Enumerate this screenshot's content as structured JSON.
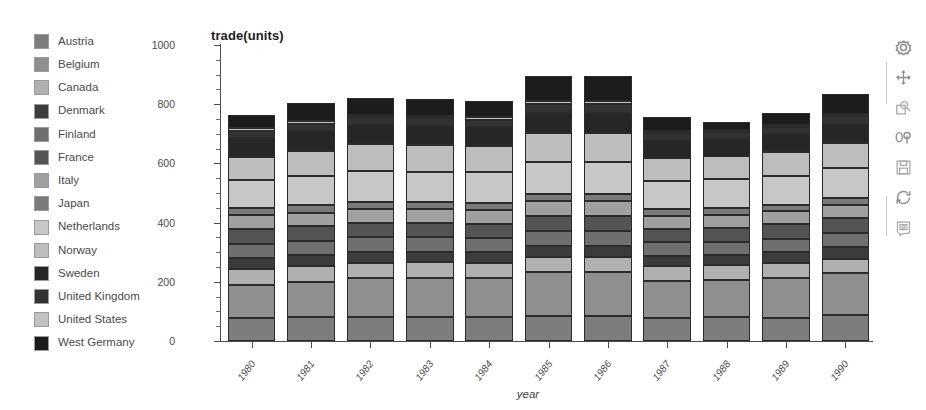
{
  "chart_data": {
    "type": "bar",
    "stacked": true,
    "title": "trade(units)",
    "xlabel": "year",
    "ylabel": "",
    "ylim": [
      0,
      1000
    ],
    "yticks": [
      0,
      200,
      400,
      600,
      800,
      1000
    ],
    "ytick_labels": [
      "0",
      "200",
      "400",
      "600",
      "800",
      "1000"
    ],
    "grid": false,
    "legend_position": "left",
    "categories": [
      "1980",
      "1981",
      "1982",
      "1983",
      "1984",
      "1985",
      "1986",
      "1987",
      "1988",
      "1989",
      "1990"
    ],
    "series": [
      {
        "name": "Austria",
        "color": "#7d7d7d",
        "values": [
          78,
          80,
          80,
          80,
          80,
          86,
          86,
          78,
          80,
          78,
          88
        ]
      },
      {
        "name": "Belgium",
        "color": "#8f8f8f",
        "values": [
          110,
          120,
          132,
          134,
          134,
          146,
          146,
          126,
          126,
          136,
          142
        ]
      },
      {
        "name": "Canada",
        "color": "#b0b0b0",
        "values": [
          55,
          52,
          52,
          52,
          50,
          52,
          52,
          50,
          50,
          50,
          46
        ]
      },
      {
        "name": "Denmark",
        "color": "#3c3c3c",
        "values": [
          38,
          38,
          38,
          36,
          36,
          38,
          38,
          34,
          34,
          36,
          40
        ]
      },
      {
        "name": "Finland",
        "color": "#6f6f6f",
        "values": [
          48,
          48,
          48,
          48,
          48,
          50,
          50,
          46,
          46,
          46,
          48
        ]
      },
      {
        "name": "France",
        "color": "#545454",
        "values": [
          50,
          50,
          50,
          50,
          48,
          52,
          52,
          46,
          46,
          48,
          50
        ]
      },
      {
        "name": "Italy",
        "color": "#a0a0a0",
        "values": [
          46,
          46,
          46,
          46,
          46,
          48,
          48,
          44,
          44,
          44,
          46
        ]
      },
      {
        "name": "Japan",
        "color": "#7a7a7a",
        "values": [
          24,
          24,
          24,
          24,
          24,
          26,
          26,
          22,
          22,
          22,
          24
        ]
      },
      {
        "name": "Netherlands",
        "color": "#c7c7c7",
        "values": [
          96,
          100,
          106,
          102,
          104,
          108,
          108,
          94,
          98,
          96,
          100
        ]
      },
      {
        "name": "Norway",
        "color": "#bdbdbd",
        "values": [
          78,
          84,
          88,
          90,
          90,
          96,
          96,
          78,
          78,
          82,
          86
        ]
      },
      {
        "name": "Sweden",
        "color": "#262626",
        "values": [
          62,
          66,
          66,
          64,
          62,
          70,
          70,
          60,
          58,
          60,
          64
        ]
      },
      {
        "name": "United Kingdom",
        "color": "#333333",
        "values": [
          26,
          26,
          26,
          26,
          26,
          28,
          28,
          24,
          24,
          24,
          26
        ]
      },
      {
        "name": "United States",
        "color": "#c2c2c2",
        "values": [
          8,
          8,
          8,
          8,
          8,
          10,
          10,
          8,
          8,
          8,
          8
        ]
      },
      {
        "name": "West Germany",
        "color": "#1c1c1c",
        "values": [
          43,
          63,
          58,
          56,
          54,
          84,
          84,
          46,
          26,
          42,
          66
        ]
      }
    ],
    "totals": [
      762,
      805,
      822,
      816,
      810,
      894,
      894,
      756,
      740,
      772,
      834
    ]
  },
  "legend": {
    "items": [
      {
        "label": "Austria",
        "color": "#7d7d7d"
      },
      {
        "label": "Belgium",
        "color": "#8f8f8f"
      },
      {
        "label": "Canada",
        "color": "#b0b0b0"
      },
      {
        "label": "Denmark",
        "color": "#3c3c3c"
      },
      {
        "label": "Finland",
        "color": "#6f6f6f"
      },
      {
        "label": "France",
        "color": "#545454"
      },
      {
        "label": "Italy",
        "color": "#a0a0a0"
      },
      {
        "label": "Japan",
        "color": "#7a7a7a"
      },
      {
        "label": "Netherlands",
        "color": "#c7c7c7"
      },
      {
        "label": "Norway",
        "color": "#bdbdbd"
      },
      {
        "label": "Sweden",
        "color": "#262626"
      },
      {
        "label": "United Kingdom",
        "color": "#333333"
      },
      {
        "label": "United States",
        "color": "#c2c2c2"
      },
      {
        "label": "West Germany",
        "color": "#1c1c1c"
      }
    ]
  },
  "toolbar": {
    "items": [
      {
        "name": "settings-icon",
        "title": "Settings"
      },
      {
        "name": "pan-icon",
        "title": "Pan"
      },
      {
        "name": "zoom-icon",
        "title": "Zoom"
      },
      {
        "name": "rotate-3d-icon",
        "title": "Rotate"
      },
      {
        "name": "save-icon",
        "title": "Save"
      },
      {
        "name": "refresh-icon",
        "title": "Refresh"
      },
      {
        "name": "snapshot-icon",
        "title": "Snapshot"
      }
    ]
  }
}
